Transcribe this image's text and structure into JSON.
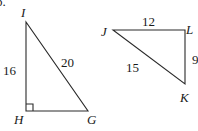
{
  "problem_marker": "b.",
  "triangles": [
    {
      "name": "IHG",
      "vertices": {
        "I": {
          "label": "I",
          "x": 26,
          "y": 22
        },
        "H": {
          "label": "H",
          "x": 26,
          "y": 111
        },
        "G": {
          "label": "G",
          "x": 88,
          "y": 111
        }
      },
      "right_angle_at": "H",
      "sides": {
        "IH": {
          "label": "16"
        },
        "IG": {
          "label": "20"
        }
      }
    },
    {
      "name": "JLK",
      "vertices": {
        "J": {
          "label": "J",
          "x": 113,
          "y": 30
        },
        "L": {
          "label": "L",
          "x": 185,
          "y": 30
        },
        "K": {
          "label": "K",
          "x": 185,
          "y": 84
        }
      },
      "sides": {
        "JL": {
          "label": "12"
        },
        "JK": {
          "label": "15"
        },
        "LK": {
          "label": "9"
        }
      }
    }
  ],
  "colors": {
    "stroke": "#2a2a2a",
    "text": "#1a1a1a",
    "background": "#ffffff"
  }
}
